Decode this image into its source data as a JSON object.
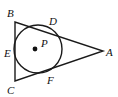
{
  "figure": {
    "kind": "inscribed-circle-in-triangle",
    "background_color": "#ffffff",
    "stroke_color": "#1a1a1a",
    "labels": {
      "vertex_b": "B",
      "vertex_c": "C",
      "vertex_a": "A",
      "tangent_d": "D",
      "tangent_e": "E",
      "tangent_f": "F",
      "center_p": "P"
    },
    "geometry": {
      "triangle": {
        "b": {
          "x": 15,
          "y": 22
        },
        "c": {
          "x": 15,
          "y": 81
        },
        "a": {
          "x": 103,
          "y": 51
        }
      },
      "circle": {
        "cx": 38,
        "cy": 49,
        "r": 24
      },
      "center_dot": {
        "cx": 35,
        "cy": 49,
        "r": 2.4
      },
      "tangent_points": {
        "d": {
          "x": 47,
          "y": 27
        },
        "e": {
          "x": 15,
          "y": 49
        },
        "f": {
          "x": 45,
          "y": 72
        }
      }
    },
    "label_positions": {
      "vertex_b": {
        "x": 7,
        "y": 17
      },
      "vertex_c": {
        "x": 7,
        "y": 92
      },
      "vertex_a": {
        "x": 107,
        "y": 56
      },
      "tangent_d": {
        "x": 49,
        "y": 25
      },
      "tangent_e": {
        "x": 6,
        "y": 57
      },
      "tangent_f": {
        "x": 48,
        "y": 83
      },
      "center_p": {
        "x": 41,
        "y": 47
      }
    }
  }
}
